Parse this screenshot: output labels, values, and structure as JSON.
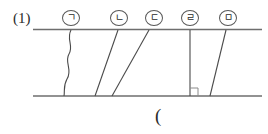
{
  "figure": {
    "problem_number": "(1)",
    "answer_bracket": "(",
    "line_color": "#6e6e6e",
    "label_color": "#2b2b2b",
    "labels": [
      {
        "id": "a",
        "text": "ㄱ",
        "x": 62,
        "y": 10
      },
      {
        "id": "b",
        "text": "ㄴ",
        "x": 110,
        "y": 10
      },
      {
        "id": "c",
        "text": "ㄷ",
        "x": 145,
        "y": 10
      },
      {
        "id": "d",
        "text": "ㄹ",
        "x": 181,
        "y": 10
      },
      {
        "id": "e",
        "text": "ㅁ",
        "x": 219,
        "y": 10
      }
    ],
    "parallel_lines": [
      {
        "id": "top-line",
        "x1": 33,
        "y1": 29.5,
        "x2": 262,
        "y2": 29.5
      },
      {
        "id": "bottom-line",
        "x1": 33,
        "y1": 96,
        "x2": 262,
        "y2": 96
      }
    ],
    "transversals": [
      {
        "id": "curve-a",
        "type": "wavy",
        "top_x": 71,
        "bottom_x": 64
      },
      {
        "id": "line-b",
        "type": "straight",
        "top_x": 118,
        "bottom_x": 95
      },
      {
        "id": "line-c",
        "type": "straight",
        "top_x": 149,
        "bottom_x": 112
      },
      {
        "id": "line-d",
        "type": "straight",
        "top_x": 190,
        "bottom_x": 190
      },
      {
        "id": "line-e",
        "type": "straight",
        "top_x": 226,
        "bottom_x": 210
      }
    ],
    "right_angle_mark": {
      "id": "right-angle-d",
      "x": 190,
      "y": 96,
      "size": 8
    }
  }
}
